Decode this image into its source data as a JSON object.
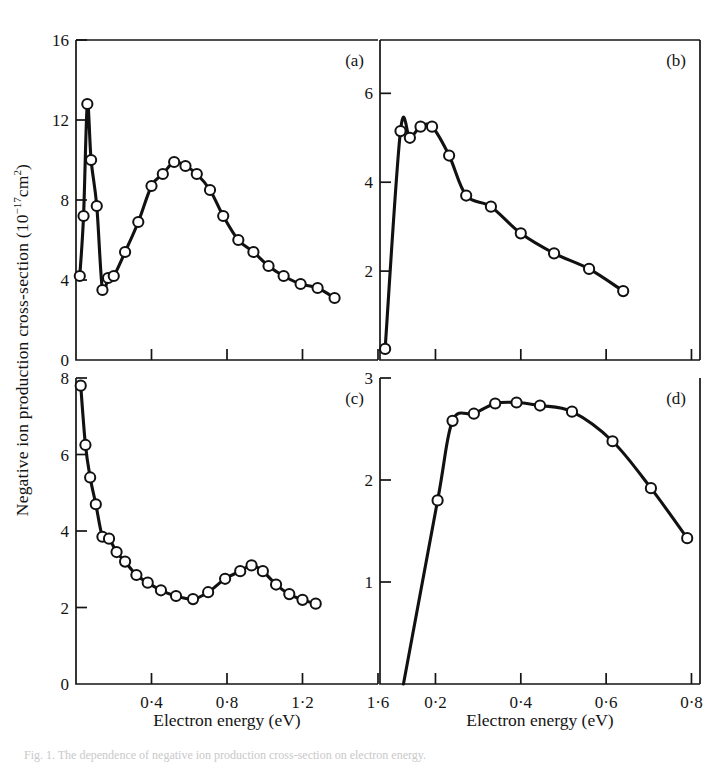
{
  "figure": {
    "y_axis_title_main": "Negative ion production cross-section (10",
    "y_axis_title_exp": "−17",
    "y_axis_title_tail": "cm",
    "y_axis_title_exp2": "2",
    "y_axis_title_close": ")",
    "y_axis_title_plain": "Negative ion production cross-section (10⁻¹⁷cm²)",
    "x_axis_title_left": "Electron energy (eV)",
    "x_axis_title_right": "Electron energy (eV)",
    "caption": "Fig. 1. The dependence of negative ion production cross-section on electron energy."
  },
  "chart_data": [
    {
      "type": "line",
      "panel": "a",
      "label": "(a)",
      "title": "",
      "xlabel": "Electron energy (eV)",
      "ylabel": "Negative ion production cross-section (10⁻¹⁷cm²)",
      "xlim": [
        0.0,
        1.6
      ],
      "ylim": [
        0,
        16
      ],
      "xticks": [
        0.4,
        0.8,
        1.2,
        1.6
      ],
      "xtick_labels": [
        "0·4",
        "0·8",
        "1·2",
        "1·6"
      ],
      "yticks": [
        0,
        4,
        8,
        12,
        16
      ],
      "ytick_labels": [
        "0",
        "4",
        "8",
        "12",
        "16"
      ],
      "grid": false,
      "legend": "none",
      "marker": "open-circle",
      "x": [
        0.02,
        0.04,
        0.06,
        0.08,
        0.11,
        0.14,
        0.17,
        0.2,
        0.26,
        0.33,
        0.4,
        0.46,
        0.52,
        0.58,
        0.64,
        0.71,
        0.78,
        0.86,
        0.94,
        1.02,
        1.1,
        1.19,
        1.28,
        1.37
      ],
      "y": [
        4.2,
        7.2,
        12.8,
        10.0,
        7.7,
        3.5,
        4.1,
        4.2,
        5.4,
        6.9,
        8.7,
        9.3,
        9.9,
        9.7,
        9.3,
        8.5,
        7.2,
        6.0,
        5.4,
        4.7,
        4.2,
        3.8,
        3.6,
        3.1
      ]
    },
    {
      "type": "line",
      "panel": "b",
      "label": "(b)",
      "title": "",
      "xlabel": "Electron energy (eV)",
      "ylabel": "Negative ion production cross-section (10⁻¹⁷cm²)",
      "xlim": [
        0.07,
        0.82
      ],
      "ylim": [
        0,
        7.2
      ],
      "xticks": [
        0.2,
        0.4,
        0.6,
        0.8
      ],
      "xtick_labels": [
        "0·2",
        "0·4",
        "0·6",
        "0·8"
      ],
      "yticks": [
        2,
        4,
        6
      ],
      "ytick_labels": [
        "2",
        "4",
        "6"
      ],
      "grid": false,
      "legend": "none",
      "marker": "open-circle",
      "x": [
        0.082,
        0.118,
        0.14,
        0.165,
        0.192,
        0.232,
        0.272,
        0.33,
        0.4,
        0.478,
        0.56,
        0.64
      ],
      "y": [
        0.25,
        5.15,
        5.0,
        5.25,
        5.25,
        4.6,
        3.7,
        3.45,
        2.85,
        2.4,
        2.05,
        1.55
      ]
    },
    {
      "type": "line",
      "panel": "c",
      "label": "(c)",
      "title": "",
      "xlabel": "Electron energy (eV)",
      "ylabel": "Negative ion production cross-section (10⁻¹⁷cm²)",
      "xlim": [
        0.0,
        1.6
      ],
      "ylim": [
        0,
        8
      ],
      "xticks": [
        0.4,
        0.8,
        1.2,
        1.6
      ],
      "xtick_labels": [
        "0·4",
        "0·8",
        "1·2",
        "1·6"
      ],
      "yticks": [
        0,
        2,
        4,
        6,
        8
      ],
      "ytick_labels": [
        "0",
        "2",
        "4",
        "6",
        "8"
      ],
      "grid": false,
      "legend": "none",
      "marker": "open-circle",
      "x": [
        0.025,
        0.05,
        0.075,
        0.105,
        0.14,
        0.175,
        0.215,
        0.26,
        0.32,
        0.38,
        0.45,
        0.53,
        0.62,
        0.7,
        0.79,
        0.87,
        0.93,
        0.99,
        1.06,
        1.13,
        1.2,
        1.27
      ],
      "y": [
        7.8,
        6.25,
        5.4,
        4.7,
        3.85,
        3.8,
        3.45,
        3.2,
        2.85,
        2.65,
        2.45,
        2.3,
        2.22,
        2.4,
        2.75,
        2.95,
        3.1,
        2.95,
        2.6,
        2.35,
        2.2,
        2.1
      ]
    },
    {
      "type": "line",
      "panel": "d",
      "label": "(d)",
      "title": "",
      "xlabel": "Electron energy (eV)",
      "ylabel": "Negative ion production cross-section (10⁻¹⁷cm²)",
      "xlim": [
        0.07,
        0.82
      ],
      "ylim": [
        0,
        3
      ],
      "xticks": [
        0.2,
        0.4,
        0.6,
        0.8
      ],
      "xtick_labels": [
        "0·2",
        "0·4",
        "0·6",
        "0·8"
      ],
      "yticks": [
        1,
        2,
        3
      ],
      "ytick_labels": [
        "1",
        "2",
        "3"
      ],
      "grid": false,
      "legend": "none",
      "marker": "open-circle",
      "x": [
        0.125,
        0.205,
        0.24,
        0.29,
        0.34,
        0.39,
        0.445,
        0.52,
        0.615,
        0.705,
        0.79
      ],
      "y": [
        0.0,
        1.8,
        2.58,
        2.65,
        2.75,
        2.76,
        2.73,
        2.67,
        2.38,
        1.92,
        1.43
      ]
    }
  ]
}
